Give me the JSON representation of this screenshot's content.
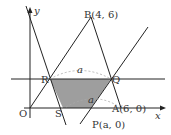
{
  "diagram": {
    "type": "coordinate-geometry",
    "axes": {
      "x_label": "x",
      "y_label": "y",
      "origin_label": "O"
    },
    "points": {
      "O": {
        "label": "O"
      },
      "A": {
        "label": "A(6, 0)"
      },
      "B": {
        "label": "B(4, 6)"
      },
      "P": {
        "label": "P(a, 0)"
      },
      "Q": {
        "label": "Q"
      },
      "R": {
        "label": "R"
      },
      "S": {
        "label": "S"
      }
    },
    "dimension_labels": {
      "rq": "a",
      "sp": "a"
    },
    "colors": {
      "shade": "#9e9e9e",
      "line": "#222222",
      "dash": "#aaaaaa"
    }
  }
}
